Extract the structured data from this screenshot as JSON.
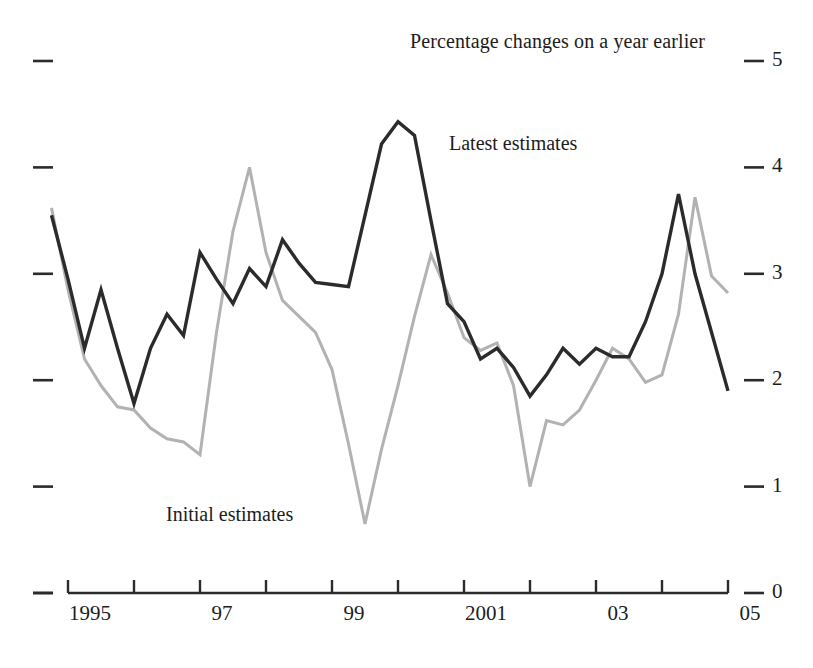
{
  "chart_data": {
    "type": "line",
    "title": "Percentage changes on a year earlier",
    "xlabel": "",
    "ylabel": "",
    "ylim": [
      0,
      5
    ],
    "xlim": [
      1994.75,
      2005.0
    ],
    "grid": false,
    "legend": "inline-annotations",
    "y_ticks": [
      "5",
      "4",
      "3",
      "2",
      "1",
      "0"
    ],
    "y_tick_values": [
      5,
      4,
      3,
      2,
      1,
      0
    ],
    "x_ticks": [
      "1995",
      "",
      "97",
      "",
      "99",
      "",
      "2001",
      "",
      "03",
      "",
      "05"
    ],
    "x_tick_values": [
      1995,
      1996,
      1997,
      1998,
      1999,
      2000,
      2001,
      2002,
      2003,
      2004,
      2005
    ],
    "x": [
      1994.75,
      1995.0,
      1995.25,
      1995.5,
      1995.75,
      1996.0,
      1996.25,
      1996.5,
      1996.75,
      1997.0,
      1997.25,
      1997.5,
      1997.75,
      1998.0,
      1998.25,
      1998.5,
      1998.75,
      1999.0,
      1999.25,
      1999.5,
      1999.75,
      2000.0,
      2000.25,
      2000.5,
      2000.75,
      2001.0,
      2001.25,
      2001.5,
      2001.75,
      2002.0,
      2002.25,
      2002.5,
      2002.75,
      2003.0,
      2003.25,
      2003.5,
      2003.75,
      2004.0,
      2004.25,
      2004.5,
      2004.75,
      2005.0
    ],
    "series": [
      {
        "name": "Latest estimates",
        "color": "#2b2b2b",
        "width": 3.4,
        "values": [
          3.55,
          2.95,
          2.3,
          2.85,
          2.3,
          1.78,
          2.3,
          2.62,
          2.42,
          3.2,
          2.95,
          2.72,
          3.05,
          2.88,
          3.32,
          3.1,
          2.92,
          2.9,
          2.88,
          3.55,
          4.22,
          4.43,
          4.3,
          3.5,
          2.72,
          2.55,
          2.2,
          2.3,
          2.12,
          1.85,
          2.05,
          2.3,
          2.15,
          2.3,
          2.22,
          2.22,
          2.55,
          3.0,
          3.75,
          3.0,
          2.45,
          1.9
        ]
      },
      {
        "name": "Initial estimates",
        "color": "#b2b2b2",
        "width": 3.0,
        "values": [
          3.62,
          2.85,
          2.2,
          1.95,
          1.75,
          1.72,
          1.55,
          1.45,
          1.42,
          1.3,
          2.45,
          3.4,
          4.0,
          3.2,
          2.75,
          2.6,
          2.45,
          2.1,
          1.4,
          0.65,
          1.35,
          1.95,
          2.6,
          3.18,
          2.82,
          2.4,
          2.28,
          2.35,
          1.95,
          1.0,
          1.62,
          1.58,
          1.72,
          2.0,
          2.3,
          2.2,
          1.98,
          2.05,
          2.62,
          3.72,
          2.98,
          2.82
        ]
      }
    ],
    "annotations": [
      {
        "text": "Latest estimates",
        "x_px": 449,
        "y_px": 132
      },
      {
        "text": "Initial estimates",
        "x_px": 166,
        "y_px": 503
      }
    ]
  }
}
